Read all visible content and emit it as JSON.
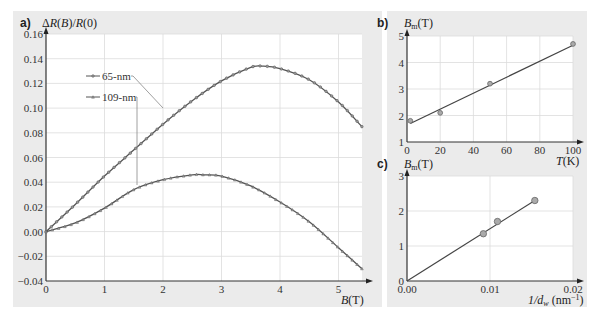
{
  "panels": {
    "a": {
      "letter": "a)",
      "ylabel": "ΔR(B)/R(0)",
      "xlabel": "B(T)"
    },
    "b": {
      "letter": "b)",
      "ylabel": "Bm(T)",
      "xlabel": "T(K)"
    },
    "c": {
      "letter": "c)",
      "ylabel": "Bm(T)",
      "xlabel": "1/dw (nm⁻¹)"
    }
  },
  "legend": {
    "series1": "65-nm",
    "series2": "109-nm"
  },
  "chart_data": [
    {
      "panel": "a",
      "type": "line",
      "title": "",
      "xlabel": "B(T)",
      "ylabel": "ΔR(B)/R(0)",
      "xlim": [
        0,
        5.4
      ],
      "ylim": [
        -0.04,
        0.16
      ],
      "xticks": [
        0,
        1,
        2,
        3,
        4,
        5
      ],
      "yticks": [
        "-0.04",
        "-0.02",
        "0.00",
        "0.02",
        "0.04",
        "0.06",
        "0.08",
        "0.10",
        "0.12",
        "0.14",
        "0.16"
      ],
      "grid": true,
      "legend_position": "upper-left",
      "series": [
        {
          "name": "65-nm",
          "x": [
            0,
            0.5,
            1.0,
            1.5,
            2.0,
            2.5,
            3.0,
            3.5,
            3.7,
            4.0,
            4.5,
            5.0,
            5.4
          ],
          "values": [
            0.0,
            0.022,
            0.045,
            0.066,
            0.087,
            0.106,
            0.122,
            0.133,
            0.134,
            0.132,
            0.123,
            0.105,
            0.085
          ]
        },
        {
          "name": "109-nm",
          "x": [
            0,
            0.5,
            1.0,
            1.5,
            2.0,
            2.5,
            2.7,
            3.0,
            3.5,
            4.0,
            4.5,
            5.0,
            5.4
          ],
          "values": [
            0.0,
            0.007,
            0.019,
            0.034,
            0.042,
            0.046,
            0.046,
            0.045,
            0.037,
            0.024,
            0.008,
            -0.013,
            -0.03
          ]
        }
      ]
    },
    {
      "panel": "b",
      "type": "scatter",
      "xlabel": "T(K)",
      "ylabel": "Bm(T)",
      "xlim": [
        0,
        100
      ],
      "ylim": [
        1,
        5
      ],
      "xticks": [
        0,
        20,
        40,
        60,
        80,
        100
      ],
      "yticks": [
        1,
        2,
        3,
        4,
        5
      ],
      "grid": true,
      "series": [
        {
          "name": "data",
          "x": [
            2,
            20,
            50,
            100
          ],
          "values": [
            1.8,
            2.1,
            3.2,
            4.7
          ]
        },
        {
          "name": "fit",
          "x": [
            2,
            100
          ],
          "values": [
            1.7,
            4.65
          ]
        }
      ]
    },
    {
      "panel": "c",
      "type": "scatter",
      "xlabel": "1/dw (nm⁻¹)",
      "ylabel": "Bm(T)",
      "xlim": [
        0,
        0.02
      ],
      "ylim": [
        0,
        3
      ],
      "xticks": [
        "0.00",
        "0.01",
        "0.02"
      ],
      "yticks": [
        0,
        1,
        2,
        3
      ],
      "grid": true,
      "series": [
        {
          "name": "data",
          "x": [
            0.0092,
            0.0109,
            0.0154
          ],
          "values": [
            1.35,
            1.7,
            2.3
          ]
        },
        {
          "name": "fit",
          "x": [
            0,
            0.0154
          ],
          "values": [
            0,
            2.3
          ]
        }
      ]
    }
  ]
}
